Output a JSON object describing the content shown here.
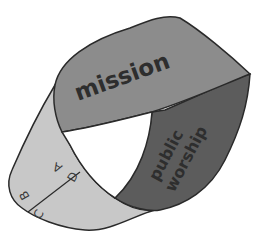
{
  "diagram": {
    "type": "mobius-strip",
    "regions": [
      {
        "id": "mission",
        "label": "mission",
        "color": "#8c8c8c"
      },
      {
        "id": "public-worship",
        "label_line1": "public",
        "label_line2": "worship",
        "color": "#5c5c5c"
      },
      {
        "id": "lower-band",
        "color": "#c8c8c8"
      }
    ],
    "segment_labels": {
      "a": "A",
      "b": "B",
      "c": "C",
      "d": "D"
    },
    "outline_color": "#2a2a2a",
    "text_color": "#2e2e2e"
  }
}
